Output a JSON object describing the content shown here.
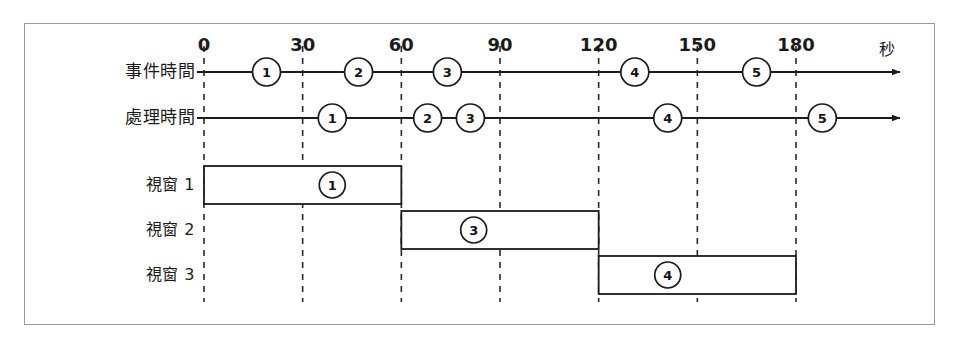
{
  "figure": {
    "title": "",
    "unit_label": "秒",
    "axis_color": "#1b1b1b",
    "grid_color": "#2a2a2a",
    "bar_color": "#ffffff",
    "bar_border_color": "#1b1b1b",
    "frame_color": "#9a9a9a"
  },
  "chart_data": {
    "type": "timeline",
    "title": "",
    "xlabel": "秒",
    "ylabel": "",
    "xlim": [
      0,
      195
    ],
    "ticks": [
      0,
      30,
      60,
      90,
      120,
      150,
      180
    ],
    "tick_labels": [
      "0",
      "30",
      "60",
      "90",
      "120",
      "150",
      "180"
    ],
    "grid": true,
    "grid_style": "dashed",
    "legend": "none",
    "axes": [
      {
        "name": "event-time",
        "label": "事件時間",
        "events": [
          {
            "id": "1",
            "t": 19
          },
          {
            "id": "2",
            "t": 47
          },
          {
            "id": "3",
            "t": 74
          },
          {
            "id": "4",
            "t": 131
          },
          {
            "id": "5",
            "t": 168
          }
        ]
      },
      {
        "name": "processing-time",
        "label": "處理時間",
        "events": [
          {
            "id": "1",
            "t": 39
          },
          {
            "id": "2",
            "t": 68
          },
          {
            "id": "3",
            "t": 81
          },
          {
            "id": "4",
            "t": 141
          },
          {
            "id": "5",
            "t": 188
          }
        ]
      }
    ],
    "windows": [
      {
        "name": "window-1",
        "label": "視窗 1",
        "start": 0,
        "end": 60,
        "event_id": "1",
        "event_t": 39
      },
      {
        "name": "window-2",
        "label": "視窗 2",
        "start": 60,
        "end": 120,
        "event_id": "3",
        "event_t": 82
      },
      {
        "name": "window-3",
        "label": "視窗 3",
        "start": 120,
        "end": 180,
        "event_id": "4",
        "event_t": 141
      }
    ]
  }
}
